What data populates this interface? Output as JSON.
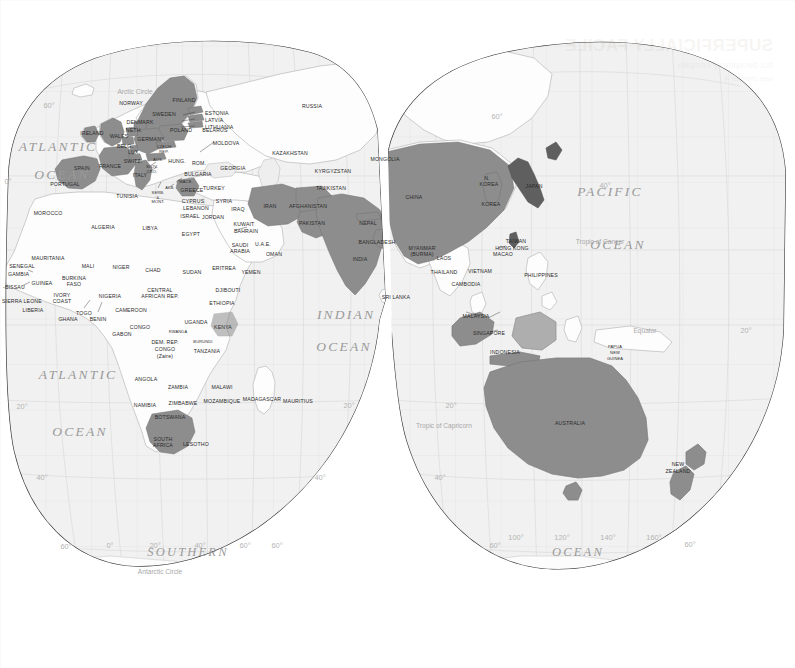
{
  "map": {
    "title": "World map (interrupted projection) — Eastern Hemisphere",
    "projection": "goode-homolosine-interrupted",
    "colors": {
      "background": "#ffffff",
      "ocean": "#f1f1f1",
      "land": "#fdfdfd",
      "land_border": "#b9b9b9",
      "highlight_fill": "#8d8d8d",
      "highlight_fill_dark": "#6e6e6e",
      "graticule": "#dcdcdc",
      "outline": "#3a3a3a",
      "label": "#2b2b2b",
      "ocean_label": "#9a9a9a"
    },
    "oceans": [
      {
        "name": "ATLANTIC",
        "sub": "OCEAN",
        "x": 42,
        "y": 148
      },
      {
        "name": "ATLANTIC",
        "sub": "OCEAN",
        "x": 70,
        "y": 375
      },
      {
        "name": "INDIAN",
        "sub": "OCEAN",
        "x": 340,
        "y": 318
      },
      {
        "name": "PACIFIC",
        "sub": "OCEAN",
        "x": 606,
        "y": 193
      },
      {
        "name": "SOUTHERN",
        "sub": "",
        "x": 185,
        "y": 553
      },
      {
        "name": "OCEAN",
        "sub": "",
        "x": 575,
        "y": 553
      }
    ],
    "reference_lines": [
      {
        "label": "Arctic Circle",
        "x": 135,
        "y": 88
      },
      {
        "label": "Tropic of Cancer",
        "x": 600,
        "y": 238
      },
      {
        "label": "Equator",
        "x": 645,
        "y": 327
      },
      {
        "label": "Tropic of Capricorn",
        "x": 420,
        "y": 422
      },
      {
        "label": "Antarctic Circle",
        "x": 160,
        "y": 568
      }
    ],
    "graticule_labels_left": [
      {
        "label": "60°",
        "x": 49,
        "y": 101
      },
      {
        "label": "0°",
        "x": 8,
        "y": 177
      },
      {
        "label": "20°",
        "x": 22,
        "y": 402
      },
      {
        "label": "40°",
        "x": 42,
        "y": 473
      },
      {
        "label": "60°",
        "x": 66,
        "y": 542
      }
    ],
    "graticule_labels_right": [
      {
        "label": "60°",
        "x": 497,
        "y": 112
      },
      {
        "label": "40°",
        "x": 605,
        "y": 181
      },
      {
        "label": "20°",
        "x": 746,
        "y": 326
      },
      {
        "label": "20°",
        "x": 349,
        "y": 401
      },
      {
        "label": "20°",
        "x": 451,
        "y": 401
      },
      {
        "label": "40°",
        "x": 320,
        "y": 473
      },
      {
        "label": "40°",
        "x": 440,
        "y": 473
      },
      {
        "label": "60°",
        "x": 277,
        "y": 541
      },
      {
        "label": "60°",
        "x": 495,
        "y": 541
      }
    ],
    "graticule_labels_bottom": [
      {
        "label": "0°",
        "x": 110,
        "y": 541
      },
      {
        "label": "20°",
        "x": 155,
        "y": 541
      },
      {
        "label": "40°",
        "x": 200,
        "y": 541
      },
      {
        "label": "60°",
        "x": 245,
        "y": 541
      },
      {
        "label": "100°",
        "x": 516,
        "y": 533
      },
      {
        "label": "120°",
        "x": 562,
        "y": 533
      },
      {
        "label": "140°",
        "x": 608,
        "y": 533
      },
      {
        "label": "160°",
        "x": 654,
        "y": 533
      },
      {
        "label": "60°",
        "x": 690,
        "y": 540
      }
    ],
    "highlighted_countries": [
      "Norway",
      "Sweden",
      "Finland",
      "Denmark",
      "Netherlands",
      "Belgium",
      "Luxembourg",
      "United Kingdom",
      "Wales",
      "Ireland",
      "France",
      "Spain",
      "Portugal",
      "Germany",
      "Switzerland",
      "Austria",
      "Italy",
      "Greece",
      "Poland",
      "Czech Republic",
      "Estonia",
      "Latvia",
      "Lithuania",
      "Iran",
      "Afghanistan",
      "Pakistan",
      "India",
      "Nepal",
      "Bangladesh",
      "China",
      "Mongolia",
      "Japan",
      "Korea",
      "N. Korea",
      "Taiwan",
      "Hong Kong",
      "Macao",
      "Indonesia",
      "Malaysia",
      "Singapore",
      "Australia",
      "New Zealand",
      "South Africa",
      "Kenya"
    ],
    "labels": [
      {
        "t": "Arctic Circle",
        "x": 135,
        "y": 88,
        "cls": "tline c"
      },
      {
        "t": "NORWAY",
        "x": 131,
        "y": 101,
        "cls": "lbl c"
      },
      {
        "t": "FINLAND",
        "x": 184,
        "y": 98,
        "cls": "lbl c"
      },
      {
        "t": "SWEDEN",
        "x": 164,
        "y": 112,
        "cls": "lbl c"
      },
      {
        "t": "ESTONIA",
        "x": 205,
        "y": 111,
        "cls": "lbl"
      },
      {
        "t": "LATVIA",
        "x": 205,
        "y": 118,
        "cls": "lbl"
      },
      {
        "t": "LITHUANIA",
        "x": 205,
        "y": 125,
        "cls": "lbl"
      },
      {
        "t": "DENMARK",
        "x": 140,
        "y": 120,
        "cls": "lbl c"
      },
      {
        "t": "NETH.",
        "x": 134,
        "y": 128,
        "cls": "lbl c"
      },
      {
        "t": "POLAND",
        "x": 181,
        "y": 128,
        "cls": "lbl c"
      },
      {
        "t": "BELARUS",
        "x": 215,
        "y": 128,
        "cls": "lbl c"
      },
      {
        "t": "IRELAND",
        "x": 92,
        "y": 131,
        "cls": "lbl c"
      },
      {
        "t": "WALES",
        "x": 119,
        "y": 134,
        "cls": "lbl c"
      },
      {
        "t": "GERMANY",
        "x": 151,
        "y": 137,
        "cls": "lbl c"
      },
      {
        "t": "BELG.",
        "x": 125,
        "y": 144,
        "cls": "lbl c"
      },
      {
        "t": "LUX.",
        "x": 134,
        "y": 150,
        "cls": "lbl c"
      },
      {
        "t": "CZECH",
        "x": 164,
        "y": 145,
        "cls": "lbl c mini"
      },
      {
        "t": "REP.",
        "x": 164,
        "y": 150,
        "cls": "lbl c mini"
      },
      {
        "t": "SWITZ.",
        "x": 133,
        "y": 159,
        "cls": "lbl c"
      },
      {
        "t": "AUS.",
        "x": 158,
        "y": 158,
        "cls": "lbl c mini"
      },
      {
        "t": "HUNG.",
        "x": 177,
        "y": 159,
        "cls": "lbl c"
      },
      {
        "t": "ROM.",
        "x": 199,
        "y": 161,
        "cls": "lbl c"
      },
      {
        "t": "MOLDOVA",
        "x": 226,
        "y": 141,
        "cls": "lbl c"
      },
      {
        "t": "FRANCE",
        "x": 110,
        "y": 164,
        "cls": "lbl c"
      },
      {
        "t": "SLOV.",
        "x": 152,
        "y": 165,
        "cls": "lbl c mini"
      },
      {
        "t": "CRO.",
        "x": 152,
        "y": 170,
        "cls": "lbl c mini"
      },
      {
        "t": "ITALY",
        "x": 140,
        "y": 173,
        "cls": "lbl c"
      },
      {
        "t": "SPAIN",
        "x": 82,
        "y": 166,
        "cls": "lbl c"
      },
      {
        "t": "PORTUGAL",
        "x": 65,
        "y": 182,
        "cls": "lbl c"
      },
      {
        "t": "BULGARIA",
        "x": 198,
        "y": 172,
        "cls": "lbl c"
      },
      {
        "t": "MACE.",
        "x": 186,
        "y": 180,
        "cls": "lbl c mini"
      },
      {
        "t": "ALB.",
        "x": 170,
        "y": 186,
        "cls": "lbl c mini"
      },
      {
        "t": "GREECE",
        "x": 192,
        "y": 188,
        "cls": "lbl c"
      },
      {
        "t": "SERB.",
        "x": 158,
        "y": 191,
        "cls": "lbl c mini"
      },
      {
        "t": "&",
        "x": 158,
        "y": 196,
        "cls": "lbl c mini"
      },
      {
        "t": "MONT.",
        "x": 158,
        "y": 200,
        "cls": "lbl c mini"
      },
      {
        "t": "TURKEY",
        "x": 214,
        "y": 186,
        "cls": "lbl c"
      },
      {
        "t": "GEORGIA",
        "x": 233,
        "y": 166,
        "cls": "lbl c"
      },
      {
        "t": "TUNISIA",
        "x": 127,
        "y": 194,
        "cls": "lbl c"
      },
      {
        "t": "CYPRUS",
        "x": 193,
        "y": 199,
        "cls": "lbl c"
      },
      {
        "t": "LEBANON",
        "x": 196,
        "y": 206,
        "cls": "lbl c"
      },
      {
        "t": "SYRIA",
        "x": 224,
        "y": 199,
        "cls": "lbl c"
      },
      {
        "t": "IRAQ",
        "x": 238,
        "y": 207,
        "cls": "lbl c"
      },
      {
        "t": "ISRAEL",
        "x": 190,
        "y": 214,
        "cls": "lbl c"
      },
      {
        "t": "JORDAN",
        "x": 213,
        "y": 215,
        "cls": "lbl c"
      },
      {
        "t": "KUWAIT",
        "x": 244,
        "y": 222,
        "cls": "lbl c"
      },
      {
        "t": "BAHRAIN",
        "x": 246,
        "y": 229,
        "cls": "lbl c"
      },
      {
        "t": "MOROCCO",
        "x": 48,
        "y": 211,
        "cls": "lbl c"
      },
      {
        "t": "ALGERIA",
        "x": 103,
        "y": 225,
        "cls": "lbl c"
      },
      {
        "t": "LIBYA",
        "x": 150,
        "y": 226,
        "cls": "lbl c"
      },
      {
        "t": "EGYPT",
        "x": 191,
        "y": 232,
        "cls": "lbl c"
      },
      {
        "t": "SAUDI",
        "x": 240,
        "y": 243,
        "cls": "lbl c"
      },
      {
        "t": "ARABIA",
        "x": 240,
        "y": 249,
        "cls": "lbl c"
      },
      {
        "t": "U.A.E.",
        "x": 263,
        "y": 242,
        "cls": "lbl c"
      },
      {
        "t": "OMAN",
        "x": 274,
        "y": 252,
        "cls": "lbl c"
      },
      {
        "t": "YEMEN",
        "x": 251,
        "y": 270,
        "cls": "lbl c"
      },
      {
        "t": "MAURITANIA",
        "x": 48,
        "y": 256,
        "cls": "lbl c"
      },
      {
        "t": "MALI",
        "x": 88,
        "y": 264,
        "cls": "lbl c"
      },
      {
        "t": "NIGER",
        "x": 121,
        "y": 265,
        "cls": "lbl c"
      },
      {
        "t": "CHAD",
        "x": 153,
        "y": 268,
        "cls": "lbl c"
      },
      {
        "t": "SUDAN",
        "x": 192,
        "y": 270,
        "cls": "lbl c"
      },
      {
        "t": "ERITREA",
        "x": 224,
        "y": 266,
        "cls": "lbl c"
      },
      {
        "t": "SENEGAL",
        "x": 22,
        "y": 264,
        "cls": "lbl c"
      },
      {
        "t": "GAMBIA",
        "x": 8,
        "y": 272,
        "cls": "lbl"
      },
      {
        "t": "-BISSAU",
        "x": 3,
        "y": 285,
        "cls": "lbl"
      },
      {
        "t": "GUINEA",
        "x": 42,
        "y": 281,
        "cls": "lbl c"
      },
      {
        "t": "BURKINA",
        "x": 74,
        "y": 276,
        "cls": "lbl c"
      },
      {
        "t": "FASO",
        "x": 74,
        "y": 282,
        "cls": "lbl c"
      },
      {
        "t": "SIERRA LEONE",
        "x": 2,
        "y": 299,
        "cls": "lbl"
      },
      {
        "t": "IVORY",
        "x": 62,
        "y": 293,
        "cls": "lbl c"
      },
      {
        "t": "COAST",
        "x": 62,
        "y": 299,
        "cls": "lbl c"
      },
      {
        "t": "NIGERIA",
        "x": 110,
        "y": 294,
        "cls": "lbl c"
      },
      {
        "t": "LIBERIA",
        "x": 33,
        "y": 308,
        "cls": "lbl c"
      },
      {
        "t": "GHANA",
        "x": 68,
        "y": 317,
        "cls": "lbl c"
      },
      {
        "t": "TOGO",
        "x": 84,
        "y": 311,
        "cls": "lbl c"
      },
      {
        "t": "BENIN",
        "x": 98,
        "y": 317,
        "cls": "lbl c"
      },
      {
        "t": "CENTRAL",
        "x": 160,
        "y": 288,
        "cls": "lbl c"
      },
      {
        "t": "AFRICAN REP.",
        "x": 160,
        "y": 294,
        "cls": "lbl c"
      },
      {
        "t": "CAMEROON",
        "x": 131,
        "y": 308,
        "cls": "lbl c"
      },
      {
        "t": "ETHIOPIA",
        "x": 222,
        "y": 301,
        "cls": "lbl c"
      },
      {
        "t": "DJIBOUTI",
        "x": 228,
        "y": 288,
        "cls": "lbl c"
      },
      {
        "t": "UGANDA",
        "x": 196,
        "y": 320,
        "cls": "lbl c"
      },
      {
        "t": "KENYA",
        "x": 223,
        "y": 325,
        "cls": "lbl c"
      },
      {
        "t": "CONGO",
        "x": 140,
        "y": 325,
        "cls": "lbl c"
      },
      {
        "t": "GABON",
        "x": 122,
        "y": 332,
        "cls": "lbl c"
      },
      {
        "t": "RWANDA",
        "x": 178,
        "y": 330,
        "cls": "lbl c mini"
      },
      {
        "t": "DEM. REP.",
        "x": 165,
        "y": 340,
        "cls": "lbl c"
      },
      {
        "t": "CONGO",
        "x": 165,
        "y": 347,
        "cls": "lbl c"
      },
      {
        "t": "(Zaire)",
        "x": 165,
        "y": 354,
        "cls": "lbl c"
      },
      {
        "t": "BURUNDI",
        "x": 203,
        "y": 340,
        "cls": "lbl c mini"
      },
      {
        "t": "TANZANIA",
        "x": 207,
        "y": 349,
        "cls": "lbl c"
      },
      {
        "t": "ANGOLA",
        "x": 146,
        "y": 377,
        "cls": "lbl c"
      },
      {
        "t": "ZAMBIA",
        "x": 178,
        "y": 385,
        "cls": "lbl c"
      },
      {
        "t": "MALAWI",
        "x": 222,
        "y": 385,
        "cls": "lbl c"
      },
      {
        "t": "NAMIBIA",
        "x": 145,
        "y": 403,
        "cls": "lbl c"
      },
      {
        "t": "ZIMBABWE",
        "x": 183,
        "y": 401,
        "cls": "lbl c"
      },
      {
        "t": "MOZAMBIQUE",
        "x": 222,
        "y": 399,
        "cls": "lbl c"
      },
      {
        "t": "MADAGASCAR",
        "x": 262,
        "y": 397,
        "cls": "lbl c"
      },
      {
        "t": "MAURITIUS",
        "x": 298,
        "y": 399,
        "cls": "lbl c"
      },
      {
        "t": "BOTSWANA",
        "x": 170,
        "y": 415,
        "cls": "lbl c"
      },
      {
        "t": "SOUTH",
        "x": 163,
        "y": 437,
        "cls": "lbl c"
      },
      {
        "t": "AFRICA",
        "x": 163,
        "y": 443,
        "cls": "lbl c"
      },
      {
        "t": "LESOTHO",
        "x": 196,
        "y": 442,
        "cls": "lbl c"
      },
      {
        "t": "RUSSIA",
        "x": 312,
        "y": 104,
        "cls": "lbl c"
      },
      {
        "t": "KAZAKHSTAN",
        "x": 290,
        "y": 151,
        "cls": "lbl c"
      },
      {
        "t": "KYRGYZSTAN",
        "x": 333,
        "y": 169,
        "cls": "lbl c"
      },
      {
        "t": "TAJIKISTAN",
        "x": 331,
        "y": 186,
        "cls": "lbl c"
      },
      {
        "t": "MONGOLIA",
        "x": 385,
        "y": 157,
        "cls": "lbl c"
      },
      {
        "t": "CHINA",
        "x": 414,
        "y": 195,
        "cls": "lbl c"
      },
      {
        "t": "IRAN",
        "x": 270,
        "y": 204,
        "cls": "lbl c"
      },
      {
        "t": "AFGHANISTAN",
        "x": 308,
        "y": 204,
        "cls": "lbl c"
      },
      {
        "t": "PAKISTAN",
        "x": 312,
        "y": 221,
        "cls": "lbl c"
      },
      {
        "t": "NEPAL",
        "x": 368,
        "y": 221,
        "cls": "lbl c"
      },
      {
        "t": "BANGLADESH",
        "x": 377,
        "y": 240,
        "cls": "lbl c"
      },
      {
        "t": "INDIA",
        "x": 360,
        "y": 257,
        "cls": "lbl c"
      },
      {
        "t": "SRI LANKA",
        "x": 396,
        "y": 295,
        "cls": "lbl c"
      },
      {
        "t": "MYANMAR",
        "x": 422,
        "y": 246,
        "cls": "lbl c"
      },
      {
        "t": "(BURMA)",
        "x": 422,
        "y": 252,
        "cls": "lbl c"
      },
      {
        "t": "LAOS",
        "x": 444,
        "y": 256,
        "cls": "lbl c"
      },
      {
        "t": "THAILAND",
        "x": 444,
        "y": 270,
        "cls": "lbl c"
      },
      {
        "t": "VIETNAM",
        "x": 480,
        "y": 269,
        "cls": "lbl c"
      },
      {
        "t": "CAMBODIA",
        "x": 466,
        "y": 282,
        "cls": "lbl c"
      },
      {
        "t": "N.",
        "x": 487,
        "y": 176,
        "cls": "lbl c"
      },
      {
        "t": "KOREA",
        "x": 489,
        "y": 182,
        "cls": "lbl c"
      },
      {
        "t": "KOREA",
        "x": 491,
        "y": 202,
        "cls": "lbl c"
      },
      {
        "t": "JAPAN",
        "x": 534,
        "y": 184,
        "cls": "lbl c"
      },
      {
        "t": "TAIWAN",
        "x": 516,
        "y": 239,
        "cls": "lbl c"
      },
      {
        "t": "HONG KONG",
        "x": 512,
        "y": 246,
        "cls": "lbl c"
      },
      {
        "t": "MACAO",
        "x": 503,
        "y": 252,
        "cls": "lbl c"
      },
      {
        "t": "PHILIPPINES",
        "x": 541,
        "y": 273,
        "cls": "lbl c"
      },
      {
        "t": "MALAYSIA",
        "x": 476,
        "y": 314,
        "cls": "lbl c"
      },
      {
        "t": "SINGAPORE",
        "x": 489,
        "y": 331,
        "cls": "lbl c"
      },
      {
        "t": "INDONESIA",
        "x": 505,
        "y": 350,
        "cls": "lbl c"
      },
      {
        "t": "PAPUA",
        "x": 615,
        "y": 345,
        "cls": "lbl c mini"
      },
      {
        "t": "NEW",
        "x": 615,
        "y": 351,
        "cls": "lbl c mini"
      },
      {
        "t": "GUINEA",
        "x": 615,
        "y": 357,
        "cls": "lbl c mini"
      },
      {
        "t": "AUSTRALIA",
        "x": 570,
        "y": 421,
        "cls": "lbl c"
      },
      {
        "t": "NEW",
        "x": 678,
        "y": 462,
        "cls": "lbl c"
      },
      {
        "t": "ZEALAND",
        "x": 678,
        "y": 469,
        "cls": "lbl c"
      },
      {
        "t": "Tropic of Cancer",
        "x": 600,
        "y": 238,
        "cls": "tline c"
      },
      {
        "t": "Equator",
        "x": 645,
        "y": 327,
        "cls": "tline c"
      },
      {
        "t": "Tropic of Capricorn",
        "x": 444,
        "y": 422,
        "cls": "tline c"
      },
      {
        "t": "Antarctic Circle",
        "x": 160,
        "y": 568,
        "cls": "tline c"
      }
    ],
    "bleed_through": {
      "line1": "SUPERFICIALLY FACILE",
      "line2": "but deceptively complex",
      "line3": "see chapter 4"
    }
  }
}
